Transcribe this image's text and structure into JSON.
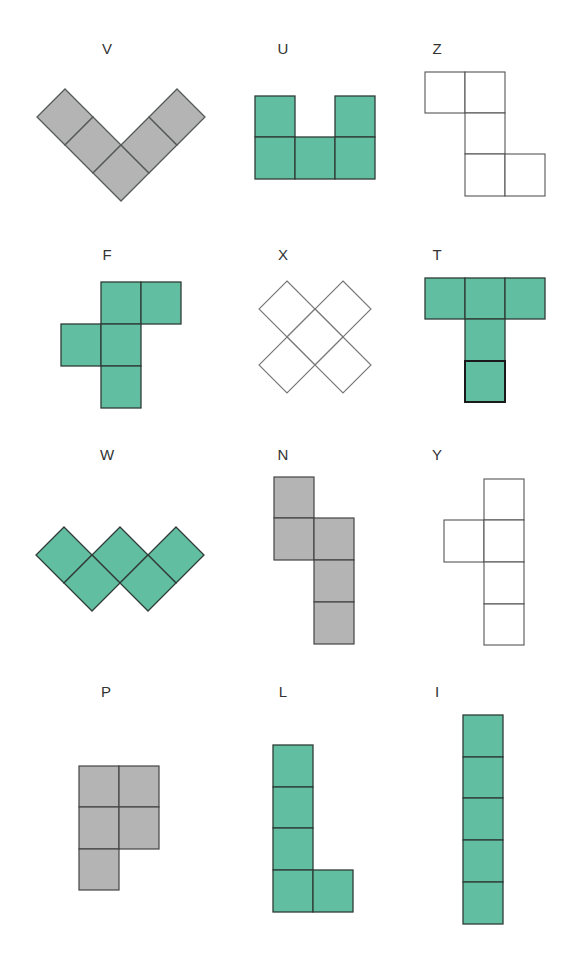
{
  "colors": {
    "gray": "#b4b4b4",
    "teal": "#62bea0",
    "white": "#ffffff",
    "stroke_dark": "#2f3d36",
    "stroke_light": "#6e6e6e"
  },
  "pieces": [
    {
      "name": "V",
      "fill": "gray",
      "rotated": true,
      "label_x": 107,
      "label_y": 40
    },
    {
      "name": "U",
      "fill": "teal",
      "rotated": false,
      "label_x": 283,
      "label_y": 40
    },
    {
      "name": "Z",
      "fill": "white",
      "rotated": false,
      "label_x": 437,
      "label_y": 40
    },
    {
      "name": "F",
      "fill": "teal",
      "rotated": false,
      "label_x": 107,
      "label_y": 246
    },
    {
      "name": "X",
      "fill": "white",
      "rotated": true,
      "label_x": 283,
      "label_y": 246
    },
    {
      "name": "T",
      "fill": "teal",
      "rotated": false,
      "label_x": 437,
      "label_y": 246
    },
    {
      "name": "W",
      "fill": "teal",
      "rotated": true,
      "label_x": 107,
      "label_y": 446
    },
    {
      "name": "N",
      "fill": "gray",
      "rotated": false,
      "label_x": 283,
      "label_y": 446
    },
    {
      "name": "Y",
      "fill": "white",
      "rotated": false,
      "label_x": 437,
      "label_y": 446
    },
    {
      "name": "P",
      "fill": "gray",
      "rotated": false,
      "label_x": 106,
      "label_y": 683
    },
    {
      "name": "L",
      "fill": "teal",
      "rotated": false,
      "label_x": 283,
      "label_y": 683
    },
    {
      "name": "I",
      "fill": "teal",
      "rotated": false,
      "label_x": 437,
      "label_y": 683
    }
  ]
}
